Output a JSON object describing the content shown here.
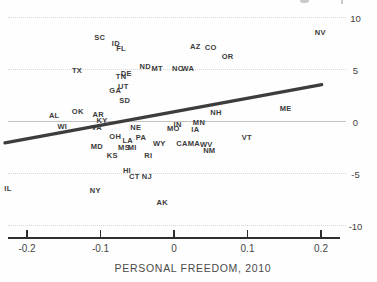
{
  "chart_data": {
    "type": "scatter",
    "title": "",
    "xlabel": "PERSONAL FREEDOM, 2010",
    "ylabel": "",
    "xlim": [
      -0.2,
      0.2
    ],
    "ylim": [
      -10,
      10
    ],
    "grid": "horizontal-only",
    "legend": "none",
    "marker_style": "state-abbreviation-text",
    "x_ticks": [
      -0.2,
      -0.1,
      0,
      0.1,
      0.2
    ],
    "x_tick_labels": [
      "-0.2",
      "-0.1",
      "0",
      "0.1",
      "0.2"
    ],
    "y_gridlines": [
      10,
      5,
      0,
      -5,
      -10
    ],
    "y_tick_labels": [
      "10",
      "5",
      "0",
      "-5",
      "-10"
    ],
    "trend_line": {
      "x1": -0.23,
      "y1": -2.1,
      "x2": 0.201,
      "y2": 3.5,
      "color": "#3d3d3d"
    },
    "points": [
      {
        "label": "SC",
        "x": -0.101,
        "y": 8.0
      },
      {
        "label": "ID",
        "x": -0.079,
        "y": 7.4
      },
      {
        "label": "FL",
        "x": -0.072,
        "y": 6.9
      },
      {
        "label": "NV",
        "x": 0.199,
        "y": 8.5
      },
      {
        "label": "AZ",
        "x": 0.029,
        "y": 7.1
      },
      {
        "label": "CO",
        "x": 0.05,
        "y": 7.0
      },
      {
        "label": "OR",
        "x": 0.073,
        "y": 6.2
      },
      {
        "label": "TX",
        "x": -0.132,
        "y": 4.8
      },
      {
        "label": "ND",
        "x": -0.039,
        "y": 5.2
      },
      {
        "label": "MT",
        "x": -0.023,
        "y": 5.0
      },
      {
        "label": "NC",
        "x": 0.005,
        "y": 5.0
      },
      {
        "label": "WA",
        "x": 0.019,
        "y": 5.0
      },
      {
        "label": "DE",
        "x": -0.065,
        "y": 4.5
      },
      {
        "label": "TN",
        "x": -0.072,
        "y": 4.2
      },
      {
        "label": "UT",
        "x": -0.069,
        "y": 3.3
      },
      {
        "label": "GA",
        "x": -0.08,
        "y": 2.9
      },
      {
        "label": "SD",
        "x": -0.067,
        "y": 1.9
      },
      {
        "label": "OK",
        "x": -0.131,
        "y": 0.9
      },
      {
        "label": "AL",
        "x": -0.163,
        "y": 0.5
      },
      {
        "label": "AR",
        "x": -0.103,
        "y": 0.6
      },
      {
        "label": "KY",
        "x": -0.098,
        "y": 0.0
      },
      {
        "label": "NH",
        "x": 0.057,
        "y": 0.8
      },
      {
        "label": "ME",
        "x": 0.152,
        "y": 1.2
      },
      {
        "label": "WI",
        "x": -0.152,
        "y": -0.6
      },
      {
        "label": "VA",
        "x": -0.105,
        "y": -0.7
      },
      {
        "label": "NE",
        "x": -0.052,
        "y": -0.7
      },
      {
        "label": "MO",
        "x": -0.001,
        "y": -0.8
      },
      {
        "label": "IN",
        "x": 0.005,
        "y": -0.4
      },
      {
        "label": "MN",
        "x": 0.034,
        "y": -0.2
      },
      {
        "label": "IA",
        "x": 0.029,
        "y": -0.9
      },
      {
        "label": "OH",
        "x": -0.08,
        "y": -1.5
      },
      {
        "label": "LA",
        "x": -0.063,
        "y": -1.9
      },
      {
        "label": "PA",
        "x": -0.045,
        "y": -1.6
      },
      {
        "label": "MD",
        "x": -0.105,
        "y": -2.5
      },
      {
        "label": "MS",
        "x": -0.068,
        "y": -2.6
      },
      {
        "label": "MI",
        "x": -0.057,
        "y": -2.6
      },
      {
        "label": "KS",
        "x": -0.084,
        "y": -3.4
      },
      {
        "label": "RI",
        "x": -0.035,
        "y": -3.4
      },
      {
        "label": "WY",
        "x": -0.02,
        "y": -2.2
      },
      {
        "label": "CA",
        "x": 0.011,
        "y": -2.2
      },
      {
        "label": "MA",
        "x": 0.027,
        "y": -2.2
      },
      {
        "label": "WV",
        "x": 0.044,
        "y": -2.3
      },
      {
        "label": "NM",
        "x": 0.048,
        "y": -2.9
      },
      {
        "label": "VT",
        "x": 0.099,
        "y": -1.6
      },
      {
        "label": "HI",
        "x": -0.064,
        "y": -4.8
      },
      {
        "label": "CT",
        "x": -0.054,
        "y": -5.4
      },
      {
        "label": "NJ",
        "x": -0.037,
        "y": -5.4
      },
      {
        "label": "IL",
        "x": -0.226,
        "y": -6.5
      },
      {
        "label": "NY",
        "x": -0.107,
        "y": -6.7
      },
      {
        "label": "AK",
        "x": -0.016,
        "y": -7.9
      }
    ]
  }
}
